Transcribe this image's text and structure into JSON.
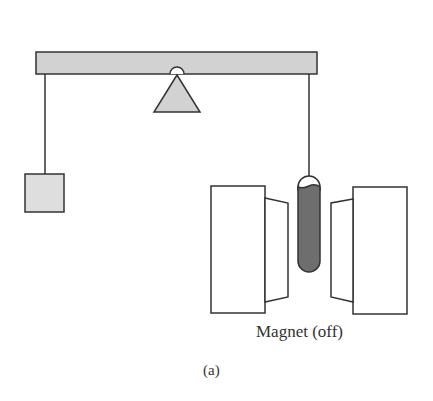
{
  "diagram": {
    "magnet_label": "Magnet (off)",
    "figure_label": "(a)",
    "components": [
      "balance-beam",
      "fulcrum",
      "counterweight",
      "sample-tube",
      "magnet-left-pole",
      "magnet-right-pole"
    ],
    "colors": {
      "beam_fill": "#d2d2d2",
      "weight_fill": "#dedede",
      "sample_fill": "#6e6e6e",
      "stroke": "#333333"
    }
  }
}
